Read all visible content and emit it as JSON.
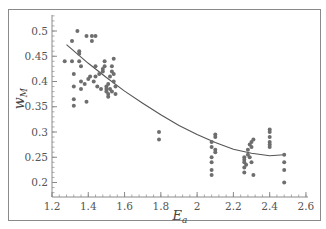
{
  "chart_data": {
    "type": "scatter",
    "title": "",
    "xlabel": "E_a",
    "ylabel": "w_M",
    "xlim": [
      1.2,
      2.6
    ],
    "ylim": [
      0.17,
      0.53
    ],
    "x_ticks": [
      1.2,
      1.4,
      1.6,
      1.8,
      2.0,
      2.2,
      2.4,
      2.6
    ],
    "x_tick_labels": [
      "1.2",
      "1.4",
      "1.6",
      "1.8",
      "2",
      "2.2",
      "2.4",
      "2.6"
    ],
    "y_ticks": [
      0.2,
      0.25,
      0.3,
      0.35,
      0.4,
      0.45,
      0.5
    ],
    "y_tick_labels": [
      "0.2",
      "0.25",
      "0.3",
      "0.35",
      "0.4",
      "0.45",
      "0.5"
    ],
    "grid": false,
    "legend": null,
    "series": [
      {
        "name": "observations",
        "kind": "scatter",
        "color": "#6e6e6e",
        "points": [
          [
            1.27,
            0.44
          ],
          [
            1.31,
            0.44
          ],
          [
            1.31,
            0.48
          ],
          [
            1.32,
            0.415
          ],
          [
            1.32,
            0.39
          ],
          [
            1.32,
            0.365
          ],
          [
            1.32,
            0.352
          ],
          [
            1.34,
            0.5
          ],
          [
            1.35,
            0.44
          ],
          [
            1.35,
            0.455
          ],
          [
            1.35,
            0.46
          ],
          [
            1.36,
            0.43
          ],
          [
            1.36,
            0.4
          ],
          [
            1.36,
            0.385
          ],
          [
            1.38,
            0.395
          ],
          [
            1.39,
            0.49
          ],
          [
            1.39,
            0.36
          ],
          [
            1.4,
            0.405
          ],
          [
            1.41,
            0.41
          ],
          [
            1.42,
            0.49
          ],
          [
            1.42,
            0.48
          ],
          [
            1.43,
            0.4
          ],
          [
            1.44,
            0.43
          ],
          [
            1.44,
            0.49
          ],
          [
            1.44,
            0.41
          ],
          [
            1.45,
            0.39
          ],
          [
            1.46,
            0.415
          ],
          [
            1.47,
            0.385
          ],
          [
            1.48,
            0.42
          ],
          [
            1.48,
            0.425
          ],
          [
            1.49,
            0.43
          ],
          [
            1.49,
            0.44
          ],
          [
            1.5,
            0.39
          ],
          [
            1.5,
            0.38
          ],
          [
            1.5,
            0.385
          ],
          [
            1.51,
            0.375
          ],
          [
            1.51,
            0.37
          ],
          [
            1.51,
            0.395
          ],
          [
            1.52,
            0.385
          ],
          [
            1.52,
            0.41
          ],
          [
            1.53,
            0.38
          ],
          [
            1.53,
            0.42
          ],
          [
            1.53,
            0.43
          ],
          [
            1.54,
            0.415
          ],
          [
            1.54,
            0.4
          ],
          [
            1.54,
            0.445
          ],
          [
            1.55,
            0.375
          ],
          [
            1.55,
            0.39
          ],
          [
            1.79,
            0.3
          ],
          [
            1.79,
            0.285
          ],
          [
            2.08,
            0.28
          ],
          [
            2.08,
            0.27
          ],
          [
            2.08,
            0.25
          ],
          [
            2.08,
            0.24
          ],
          [
            2.08,
            0.225
          ],
          [
            2.08,
            0.215
          ],
          [
            2.1,
            0.295
          ],
          [
            2.1,
            0.29
          ],
          [
            2.1,
            0.265
          ],
          [
            2.1,
            0.26
          ],
          [
            2.26,
            0.25
          ],
          [
            2.26,
            0.245
          ],
          [
            2.26,
            0.24
          ],
          [
            2.26,
            0.23
          ],
          [
            2.26,
            0.22
          ],
          [
            2.27,
            0.235
          ],
          [
            2.28,
            0.265
          ],
          [
            2.28,
            0.255
          ],
          [
            2.29,
            0.25
          ],
          [
            2.29,
            0.275
          ],
          [
            2.3,
            0.28
          ],
          [
            2.3,
            0.27
          ],
          [
            2.31,
            0.285
          ],
          [
            2.3,
            0.24
          ],
          [
            2.31,
            0.215
          ],
          [
            2.4,
            0.305
          ],
          [
            2.4,
            0.3
          ],
          [
            2.4,
            0.29
          ],
          [
            2.4,
            0.28
          ],
          [
            2.4,
            0.275
          ],
          [
            2.4,
            0.27
          ],
          [
            2.48,
            0.255
          ],
          [
            2.48,
            0.24
          ],
          [
            2.48,
            0.225
          ],
          [
            2.48,
            0.2
          ]
        ]
      },
      {
        "name": "fit",
        "kind": "line",
        "color": "#555555",
        "x": [
          1.28,
          1.4,
          1.5,
          1.6,
          1.7,
          1.8,
          1.9,
          2.0,
          2.1,
          2.2,
          2.3,
          2.4,
          2.48
        ],
        "y": [
          0.473,
          0.436,
          0.408,
          0.381,
          0.357,
          0.334,
          0.313,
          0.295,
          0.279,
          0.266,
          0.258,
          0.253,
          0.255
        ]
      }
    ]
  }
}
